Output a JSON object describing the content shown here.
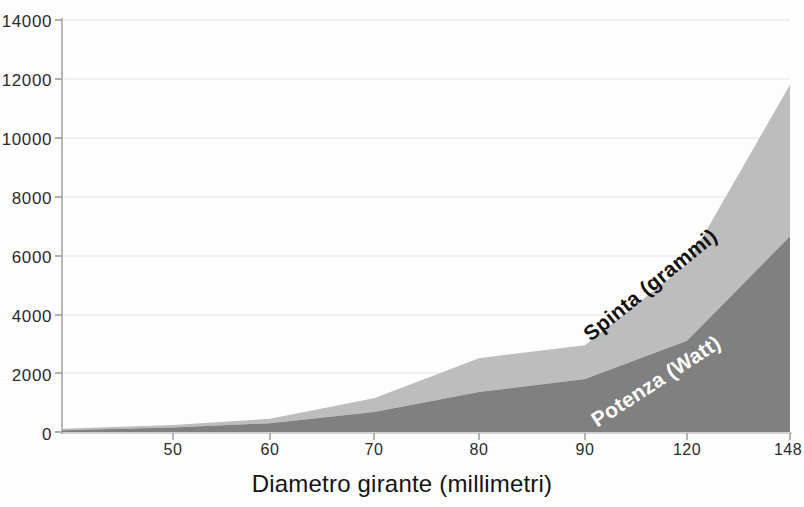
{
  "chart_data": {
    "type": "area",
    "title": "",
    "subtitle": "",
    "xlabel": "Diametro girante (millimetri)",
    "ylabel": "",
    "stacked": true,
    "grid": true,
    "legend_position": "inline-annotations",
    "x": [
      50,
      60,
      70,
      80,
      90,
      120,
      148
    ],
    "categories": [
      "50",
      "60",
      "70",
      "80",
      "90",
      "120",
      "148"
    ],
    "xtick_labels": [
      "50",
      "60",
      "70",
      "80",
      "90",
      "120",
      "148"
    ],
    "ytick_labels": [
      "0",
      "2000",
      "4000",
      "6000",
      "8000",
      "10000",
      "12000",
      "14000"
    ],
    "yticks": [
      0,
      2000,
      4000,
      6000,
      8000,
      10000,
      12000,
      14000
    ],
    "ylim": [
      0,
      14000
    ],
    "series": [
      {
        "name": "Potenza (Watt)",
        "color": "#808080",
        "label_color": "#ffffff",
        "values": [
          150,
          300,
          680,
          1360,
          1800,
          3100,
          6650
        ]
      },
      {
        "name": "Spinta (grammi)",
        "color": "#bdbdbd",
        "label_color": "#111111",
        "values": [
          90,
          150,
          470,
          1150,
          1150,
          2600,
          5150
        ]
      }
    ],
    "cumulative_totals": [
      240,
      450,
      1150,
      2510,
      2950,
      5700,
      11800
    ],
    "annotations": [
      {
        "text": "Spinta (grammi)",
        "series": "Spinta (grammi)",
        "rotation": -39
      },
      {
        "text": "Potenza (Watt)",
        "series": "Potenza (Watt)",
        "rotation": -33
      }
    ]
  },
  "axis": {
    "x_title": "Diametro girante (millimetri)",
    "y_ticks": [
      "14000",
      "12000",
      "10000",
      "8000",
      "6000",
      "4000",
      "2000",
      "0"
    ],
    "x_ticks": [
      "50",
      "60",
      "70",
      "80",
      "90",
      "120",
      "148"
    ]
  },
  "labels": {
    "spinta": "Spinta (grammi)",
    "potenza": "Potenza (Watt)"
  },
  "colors": {
    "spinta_fill": "#bdbdbd",
    "potenza_fill": "#808080",
    "grid": "#e2e2e2",
    "axis": "#9a9a9a",
    "background": "#fdfdfd",
    "text": "#1a1a1a"
  }
}
